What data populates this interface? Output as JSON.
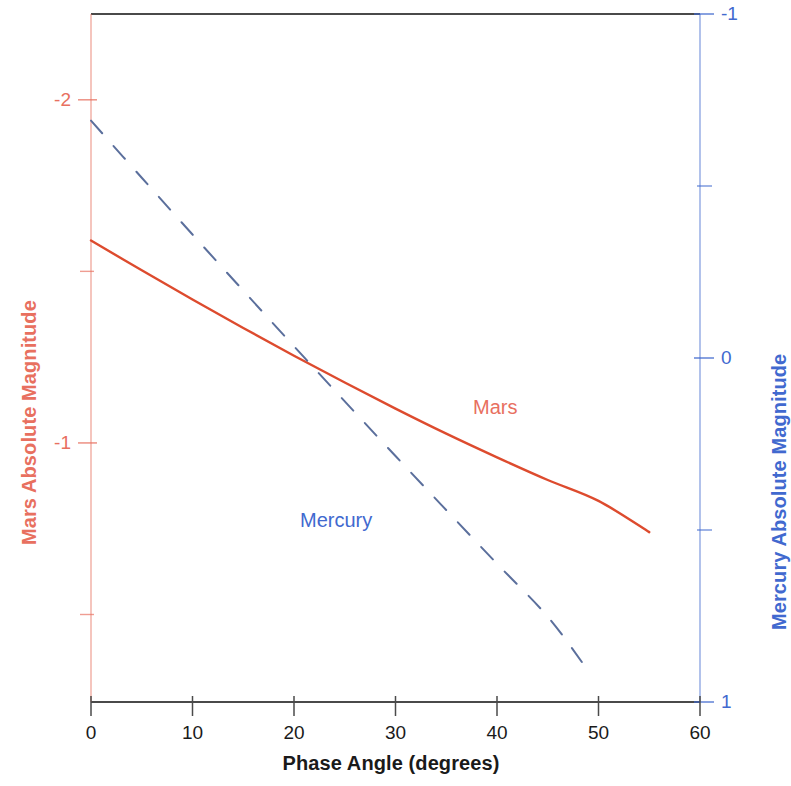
{
  "chart_data": {
    "type": "line",
    "title": "",
    "xlabel": "Phase Angle (degrees)",
    "xlim": [
      0,
      60
    ],
    "xticks": [
      0,
      10,
      20,
      30,
      40,
      50,
      60
    ],
    "xtick_labels": [
      "0",
      "10",
      "20",
      "30",
      "40",
      "50",
      "60"
    ],
    "grid": false,
    "legend_position": "inline-annotations",
    "axes": [
      {
        "id": "left",
        "side": "left",
        "label": "Mars Absolute Magnitude",
        "color": "#e8705f",
        "lim": [
          -0.245,
          -2.25
        ],
        "inverted": true,
        "major_ticks": [
          -2,
          -1
        ],
        "major_tick_labels": [
          "-2",
          "-1"
        ],
        "minor_ticks": [
          -1.5,
          -0.5
        ]
      },
      {
        "id": "right",
        "side": "right",
        "label": "Mercury Absolute Magnitude",
        "color": "#4169cf",
        "lim": [
          1.0,
          -1.0
        ],
        "inverted": true,
        "major_ticks": [
          -1,
          0,
          1
        ],
        "major_tick_labels": [
          "-1",
          "0",
          "1"
        ],
        "minor_ticks": [
          -0.5,
          0.5
        ]
      }
    ],
    "series": [
      {
        "name": "Mars",
        "axis": "left",
        "color": "#dd4b2e",
        "style": "solid",
        "width": 2.4,
        "annotation": {
          "text": "Mars",
          "x": 37.6,
          "y": -0.985
        },
        "x": [
          0,
          5,
          10,
          15,
          20,
          25,
          30,
          35,
          40,
          45,
          50,
          55
        ],
        "y": [
          -1.59,
          -1.503,
          -1.418,
          -1.335,
          -1.254,
          -1.176,
          -1.1,
          -1.027,
          -0.958,
          -0.892,
          -0.831,
          -0.74
        ]
      },
      {
        "name": "Mercury",
        "axis": "right",
        "color": "#5b6f9c",
        "style": "dashed",
        "width": 2.0,
        "dash_pattern": "17 17",
        "annotation": {
          "text": "Mercury",
          "x": 20.6,
          "y": 0.5
        },
        "x": [
          0,
          5,
          10,
          15,
          20,
          25,
          30,
          35,
          40,
          45,
          49
        ],
        "y": [
          -0.69,
          -0.524,
          -0.359,
          -0.196,
          -0.034,
          0.126,
          0.285,
          0.442,
          0.598,
          0.752,
          0.91
        ]
      }
    ]
  },
  "axis_titles": {
    "left": "Mars Absolute Magnitude",
    "right": "Mercury Absolute Magnitude",
    "bottom": "Phase Angle (degrees)"
  },
  "annotations": {
    "mars": "Mars",
    "mercury": "Mercury"
  },
  "colors": {
    "mars_accent": "#e8705f",
    "mercury_accent": "#4169cf",
    "mars_line": "#dd4b2e",
    "mercury_line": "#5b6f9c",
    "frame_dark": "#4a4a4a",
    "background": "#ffffff"
  }
}
